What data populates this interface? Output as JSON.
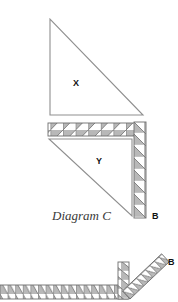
{
  "canvas": {
    "width": 178,
    "height": 302,
    "background": "#ffffff"
  },
  "style": {
    "outline_color": "#8a8a8a",
    "hatch_fill": "#b8b8b8",
    "hatch_line": "#6e6e6e",
    "triangle_line": "#8f8f8f",
    "label_color": "#111111",
    "caption_color": "#3a3a3a"
  },
  "labels": {
    "triangle_x": "X",
    "triangle_y": "Y",
    "caption": "Diagram C",
    "support_b_top": "B",
    "support_b_bottom": "B"
  },
  "diagram": {
    "title": "Diagram C",
    "shapes": [
      {
        "name": "triangle-x",
        "label": "X",
        "type": "right-triangle",
        "right_angle": "bottom-left",
        "vertices": [
          [
            50,
            19
          ],
          [
            50,
            115
          ],
          [
            143,
            115
          ]
        ]
      },
      {
        "name": "hatched-beam-top",
        "type": "hatched-horizontal-bar",
        "cells": 7,
        "rect": [
          48,
          123,
          88,
          13
        ],
        "diagonal": "bottom-left-to-top-right"
      },
      {
        "name": "triangle-y",
        "label": "Y",
        "type": "right-triangle",
        "right_angle": "top-right",
        "vertices": [
          [
            49,
            139
          ],
          [
            132,
            139
          ],
          [
            132,
            216
          ]
        ]
      },
      {
        "name": "hatched-column-right",
        "type": "hatched-vertical-bar",
        "cells": 8,
        "rect": [
          134,
          122,
          12,
          96
        ],
        "diagonal": "top-left-to-bottom-right",
        "end_label": "B"
      },
      {
        "name": "hatched-base-bottom",
        "type": "hatched-horizontal-bar",
        "cells": 17,
        "rect": [
          0,
          285,
          128,
          14
        ],
        "diagonal": "top-left-to-bottom-right"
      },
      {
        "name": "hatched-column-bottom",
        "type": "hatched-vertical-bar",
        "cells": 4,
        "rect": [
          118,
          263,
          11,
          36
        ],
        "diagonal": "top-left-to-bottom-right"
      },
      {
        "name": "hatched-diagonal-bottom",
        "type": "hatched-diagonal-bar",
        "cells": 9,
        "from": [
          130,
          298
        ],
        "to": [
          168,
          262
        ],
        "end_label": "B"
      }
    ]
  }
}
